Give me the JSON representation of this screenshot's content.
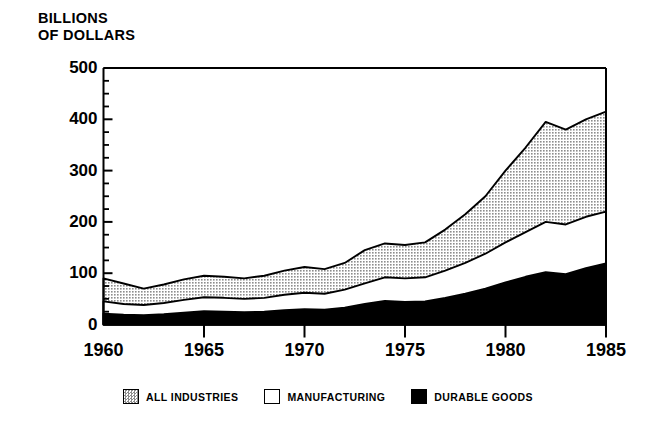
{
  "chart_data": {
    "type": "area",
    "title": "BILLIONS\nOF DOLLARS",
    "ylabel": "BILLIONS OF DOLLARS",
    "xlabel": "",
    "stacked": true,
    "grid": false,
    "legend_position": "bottom",
    "xlim": [
      1960,
      1985
    ],
    "ylim": [
      0,
      500
    ],
    "ytick_labels": [
      "0",
      "100",
      "200",
      "300",
      "400",
      "500"
    ],
    "ytick_values": [
      0,
      100,
      200,
      300,
      400,
      500
    ],
    "yminor_step": 25,
    "xtick_labels": [
      "1960",
      "1965",
      "1970",
      "1975",
      "1980",
      "1985"
    ],
    "xtick_values": [
      1960,
      1965,
      1970,
      1975,
      1980,
      1985
    ],
    "x": [
      1960,
      1961,
      1962,
      1963,
      1964,
      1965,
      1966,
      1967,
      1968,
      1969,
      1970,
      1971,
      1972,
      1973,
      1974,
      1975,
      1976,
      1977,
      1978,
      1979,
      1980,
      1981,
      1982,
      1983,
      1984,
      1985
    ],
    "series": [
      {
        "name": "ALL INDUSTRIES",
        "fill": "#d4d4d4",
        "pattern": "stipple",
        "values": [
          90,
          80,
          70,
          78,
          88,
          95,
          93,
          90,
          95,
          105,
          112,
          108,
          120,
          145,
          158,
          155,
          160,
          185,
          215,
          250,
          300,
          345,
          395,
          380,
          400,
          415
        ]
      },
      {
        "name": "MANUFACTURING",
        "fill": "#ffffff",
        "pattern": "solid",
        "values": [
          45,
          40,
          38,
          42,
          48,
          53,
          52,
          50,
          52,
          58,
          62,
          60,
          68,
          80,
          92,
          90,
          92,
          105,
          120,
          138,
          160,
          180,
          200,
          195,
          210,
          220
        ]
      },
      {
        "name": "DURABLE GOODS",
        "fill": "#000000",
        "pattern": "solid",
        "values": [
          21,
          19,
          18,
          20,
          23,
          26,
          25,
          24,
          25,
          28,
          30,
          29,
          33,
          40,
          46,
          44,
          45,
          52,
          60,
          70,
          82,
          93,
          102,
          98,
          110,
          119
        ]
      }
    ],
    "annotations": []
  },
  "legend": {
    "items": [
      {
        "label": "ALL INDUSTRIES",
        "swatch": "stipple"
      },
      {
        "label": "MANUFACTURING",
        "swatch": "white"
      },
      {
        "label": "DURABLE GOODS",
        "swatch": "black"
      }
    ]
  }
}
